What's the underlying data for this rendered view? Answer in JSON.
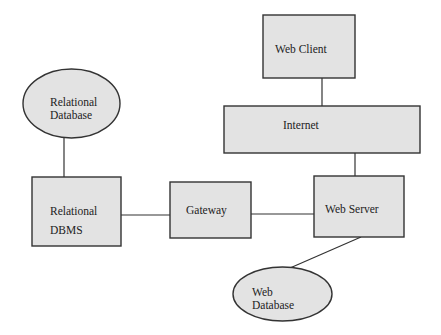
{
  "diagram": {
    "type": "architecture",
    "colors": {
      "fill": "#e3e3e3",
      "stroke": "#333333",
      "text": "#222222",
      "background": "#ffffff"
    },
    "nodes": [
      {
        "id": "relational-database",
        "shape": "ellipse",
        "label_lines": [
          "Relational",
          "Database"
        ]
      },
      {
        "id": "relational-dbms",
        "shape": "rect",
        "label_lines": [
          "Relational",
          "DBMS"
        ]
      },
      {
        "id": "gateway",
        "shape": "rect",
        "label_lines": [
          "Gateway"
        ]
      },
      {
        "id": "web-server",
        "shape": "rect",
        "label_lines": [
          "Web Server"
        ]
      },
      {
        "id": "internet",
        "shape": "rect",
        "label_lines": [
          "Internet"
        ]
      },
      {
        "id": "web-client",
        "shape": "rect",
        "label_lines": [
          "Web Client"
        ]
      },
      {
        "id": "web-database",
        "shape": "ellipse",
        "label_lines": [
          "Web",
          "Database"
        ]
      }
    ],
    "edges": [
      {
        "from": "relational-database",
        "to": "relational-dbms"
      },
      {
        "from": "relational-dbms",
        "to": "gateway"
      },
      {
        "from": "gateway",
        "to": "web-server"
      },
      {
        "from": "web-client",
        "to": "internet"
      },
      {
        "from": "internet",
        "to": "web-server"
      },
      {
        "from": "web-server",
        "to": "web-database"
      }
    ]
  }
}
